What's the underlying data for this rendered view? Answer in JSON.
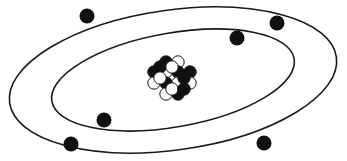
{
  "diagram": {
    "type": "atom-model",
    "background_color": "#ffffff",
    "stroke_color": "#1a1a1a",
    "canvas": {
      "width": 347,
      "height": 161
    },
    "orbits": [
      {
        "name": "outer-orbit",
        "label": "Outer electron shell",
        "cx": 173,
        "cy": 80,
        "rx": 165,
        "ry": 70,
        "rotation_deg": -8,
        "stroke_width": 1.6,
        "electron_count": 4
      },
      {
        "name": "inner-orbit",
        "label": "Inner electron shell",
        "cx": 173,
        "cy": 80,
        "rx": 123,
        "ry": 47,
        "rotation_deg": -10,
        "stroke_width": 1.6,
        "electron_count": 2
      }
    ],
    "electrons": [
      {
        "name": "electron-outer-top-left",
        "orbit": "outer-orbit",
        "cx": 87,
        "cy": 16,
        "r": 7.5,
        "color": "#111111"
      },
      {
        "name": "electron-outer-top-right",
        "orbit": "outer-orbit",
        "cx": 277,
        "cy": 23,
        "r": 7.5,
        "color": "#111111"
      },
      {
        "name": "electron-outer-bottom-left",
        "orbit": "outer-orbit",
        "cx": 71,
        "cy": 144,
        "r": 7.5,
        "color": "#111111"
      },
      {
        "name": "electron-outer-bottom-right",
        "orbit": "outer-orbit",
        "cx": 264,
        "cy": 143,
        "r": 7.5,
        "color": "#111111"
      },
      {
        "name": "electron-inner-top-right",
        "orbit": "inner-orbit",
        "cx": 237,
        "cy": 38,
        "r": 7.5,
        "color": "#111111"
      },
      {
        "name": "electron-inner-bottom-left",
        "orbit": "inner-orbit",
        "cx": 104,
        "cy": 120,
        "r": 7.5,
        "color": "#111111"
      }
    ],
    "nucleus": {
      "name": "nucleus",
      "label": "Nucleus",
      "center": {
        "x": 172,
        "y": 80
      },
      "particle_radius": 6.2,
      "proton_color": "#111111",
      "neutron_color": "#ffffff",
      "proton_count": 9,
      "neutron_count": 9,
      "particles": [
        {
          "name": "nucleon-r1-c1",
          "type": "proton",
          "cx": 166,
          "cy": 62
        },
        {
          "name": "nucleon-r1-c2",
          "type": "neutron",
          "cx": 178,
          "cy": 62
        },
        {
          "name": "nucleon-r2-c1",
          "type": "proton",
          "cx": 154,
          "cy": 72
        },
        {
          "name": "nucleon-r2-c2",
          "type": "neutron",
          "cx": 166,
          "cy": 72
        },
        {
          "name": "nucleon-r2-c3",
          "type": "proton",
          "cx": 178,
          "cy": 72
        },
        {
          "name": "nucleon-r2-c4",
          "type": "proton",
          "cx": 190,
          "cy": 72
        },
        {
          "name": "nucleon-r3-c1",
          "type": "neutron",
          "cx": 154,
          "cy": 83
        },
        {
          "name": "nucleon-r3-c2",
          "type": "proton",
          "cx": 166,
          "cy": 83
        },
        {
          "name": "nucleon-r3-c3",
          "type": "neutron",
          "cx": 178,
          "cy": 83
        },
        {
          "name": "nucleon-r3-c4",
          "type": "neutron",
          "cx": 190,
          "cy": 83
        },
        {
          "name": "nucleon-r4-c1",
          "type": "neutron",
          "cx": 166,
          "cy": 94
        },
        {
          "name": "nucleon-r4-c2",
          "type": "proton",
          "cx": 178,
          "cy": 94
        },
        {
          "name": "nucleon-r0-c1",
          "type": "proton",
          "cx": 160,
          "cy": 67
        },
        {
          "name": "nucleon-r0-c2",
          "type": "neutron",
          "cx": 172,
          "cy": 67
        },
        {
          "name": "nucleon-extra-left",
          "type": "neutron",
          "cx": 160,
          "cy": 78
        },
        {
          "name": "nucleon-extra-right",
          "type": "proton",
          "cx": 184,
          "cy": 78
        },
        {
          "name": "nucleon-extra-low-left",
          "type": "neutron",
          "cx": 172,
          "cy": 89
        },
        {
          "name": "nucleon-extra-low-right",
          "type": "proton",
          "cx": 184,
          "cy": 89
        }
      ]
    }
  }
}
